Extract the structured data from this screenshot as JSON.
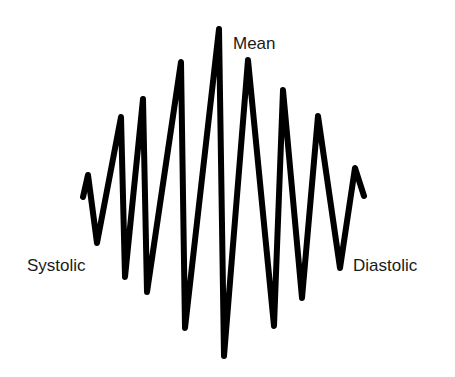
{
  "diagram": {
    "stroke_color": "#000000",
    "background_color": "#ffffff",
    "labels": {
      "mean": "Mean",
      "systolic": "Systolic",
      "diastolic": "Diastolic"
    },
    "waveform_points": [
      [
        83,
        197
      ],
      [
        88,
        175
      ],
      [
        97,
        243
      ],
      [
        121,
        117
      ],
      [
        125,
        277
      ],
      [
        143,
        99
      ],
      [
        147,
        292
      ],
      [
        181,
        62
      ],
      [
        185,
        328
      ],
      [
        219,
        29
      ],
      [
        224,
        356
      ],
      [
        248,
        60
      ],
      [
        274,
        326
      ],
      [
        283,
        90
      ],
      [
        302,
        298
      ],
      [
        318,
        116
      ],
      [
        340,
        268
      ],
      [
        355,
        168
      ],
      [
        364,
        196
      ]
    ]
  }
}
